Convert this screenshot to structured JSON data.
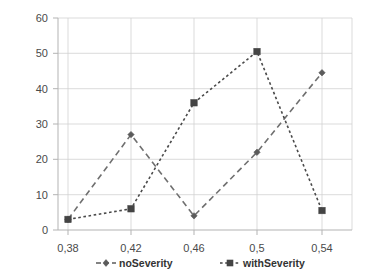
{
  "chart_data": {
    "type": "line",
    "title": "",
    "xlabel": "",
    "ylabel": "",
    "categories": [
      "0,38",
      "0,42",
      "0,46",
      "0,5",
      "0,54"
    ],
    "x_numeric": [
      0.38,
      0.42,
      0.46,
      0.5,
      0.54
    ],
    "series": [
      {
        "name": "noSeverity",
        "values": [
          3,
          27,
          4,
          22,
          44.5
        ],
        "marker": "diamond",
        "line_style": "dashed",
        "color": "#5b5b5b"
      },
      {
        "name": "withSeverity",
        "values": [
          3,
          6,
          36,
          50.5,
          5.5
        ],
        "marker": "square",
        "line_style": "dotted",
        "color": "#444444"
      }
    ],
    "ylim": [
      0,
      60
    ],
    "ytick_labels": [
      "0",
      "10",
      "20",
      "30",
      "40",
      "50",
      "60"
    ],
    "ytick_values": [
      0,
      10,
      20,
      30,
      40,
      50,
      60
    ],
    "xlim": [
      0.36,
      0.56
    ],
    "grid": "horizontal-and-vertical",
    "legend_position": "bottom"
  },
  "legend": {
    "items": [
      {
        "label": "noSeverity"
      },
      {
        "label": "withSeverity"
      }
    ]
  },
  "axes": {
    "y_labels": [
      "60",
      "50",
      "40",
      "30",
      "20",
      "10",
      "0"
    ],
    "x_labels": [
      "0,38",
      "0,42",
      "0,46",
      "0,5",
      "0,54"
    ]
  },
  "colors": {
    "grid": "#d2d2d2",
    "axis": "#b3b3b3",
    "series_a": "#5b5b5b",
    "series_b": "#444444",
    "text": "#4a4a4a",
    "background": "#ffffff"
  }
}
